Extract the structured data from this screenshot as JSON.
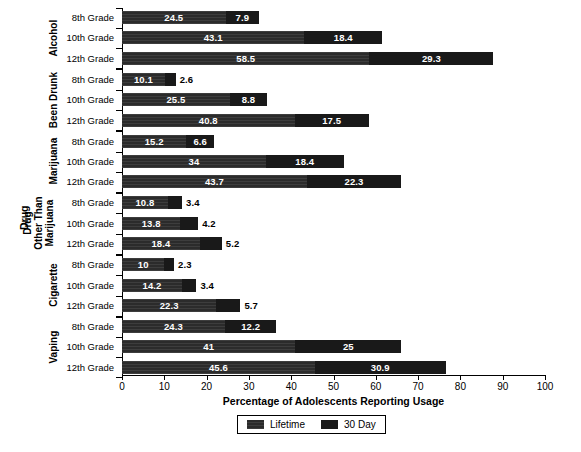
{
  "chart_data": {
    "type": "bar",
    "orientation": "horizontal",
    "stacked": true,
    "title": "",
    "xlabel": "Percentage of Adolescents Reporting Usage",
    "ylabel": "Drug",
    "xlim": [
      0,
      100
    ],
    "xticks": [
      "0",
      "10",
      "20",
      "30",
      "40",
      "50",
      "60",
      "70",
      "80",
      "90",
      "100"
    ],
    "grid": false,
    "legend_position": "bottom-center",
    "legend": [
      "Lifetime",
      "30 Day"
    ],
    "categories": [
      "8th Grade",
      "10th Grade",
      "12th Grade",
      "8th Grade",
      "10th Grade",
      "12th Grade",
      "8th Grade",
      "10th Grade",
      "12th Grade",
      "8th Grade",
      "10th Grade",
      "12th Grade",
      "8th Grade",
      "10th Grade",
      "12th Grade",
      "8th Grade",
      "10th Grade",
      "12th Grade"
    ],
    "groups": [
      {
        "label": "Alcohol",
        "rows": [
          {
            "grade": "8th Grade",
            "lifetime": 24.5,
            "day30": 7.9
          },
          {
            "grade": "10th Grade",
            "lifetime": 43.1,
            "day30": 18.4
          },
          {
            "grade": "12th Grade",
            "lifetime": 58.5,
            "day30": 29.3
          }
        ]
      },
      {
        "label": "Been Drunk",
        "rows": [
          {
            "grade": "8th Grade",
            "lifetime": 10.1,
            "day30": 2.6
          },
          {
            "grade": "10th Grade",
            "lifetime": 25.5,
            "day30": 8.8
          },
          {
            "grade": "12th Grade",
            "lifetime": 40.8,
            "day30": 17.5
          }
        ]
      },
      {
        "label": "Marijuana",
        "rows": [
          {
            "grade": "8th Grade",
            "lifetime": 15.2,
            "day30": 6.6
          },
          {
            "grade": "10th Grade",
            "lifetime": 34,
            "day30": 18.4
          },
          {
            "grade": "12th Grade",
            "lifetime": 43.7,
            "day30": 22.3
          }
        ]
      },
      {
        "label": "Drug Other Than Marijuana",
        "rows": [
          {
            "grade": "8th Grade",
            "lifetime": 10.8,
            "day30": 3.4
          },
          {
            "grade": "10th Grade",
            "lifetime": 13.8,
            "day30": 4.2
          },
          {
            "grade": "12th Grade",
            "lifetime": 18.4,
            "day30": 5.2
          }
        ]
      },
      {
        "label": "Cigarette",
        "rows": [
          {
            "grade": "8th Grade",
            "lifetime": 10,
            "day30": 2.3
          },
          {
            "grade": "10th Grade",
            "lifetime": 14.2,
            "day30": 3.4
          },
          {
            "grade": "12th Grade",
            "lifetime": 22.3,
            "day30": 5.7
          }
        ]
      },
      {
        "label": "Vaping",
        "rows": [
          {
            "grade": "8th Grade",
            "lifetime": 24.3,
            "day30": 12.2
          },
          {
            "grade": "10th Grade",
            "lifetime": 41,
            "day30": 25
          },
          {
            "grade": "12th Grade",
            "lifetime": 45.6,
            "day30": 30.9
          }
        ]
      }
    ],
    "series": [
      {
        "name": "Lifetime",
        "values": [
          24.5,
          43.1,
          58.5,
          10.1,
          25.5,
          40.8,
          15.2,
          34,
          43.7,
          10.8,
          13.8,
          18.4,
          10,
          14.2,
          22.3,
          24.3,
          41,
          45.6
        ]
      },
      {
        "name": "30 Day",
        "values": [
          7.9,
          18.4,
          29.3,
          2.6,
          8.8,
          17.5,
          6.6,
          18.4,
          22.3,
          3.4,
          4.2,
          5.2,
          2.3,
          3.4,
          5.7,
          12.2,
          25,
          30.9
        ]
      }
    ],
    "colors": {
      "lifetime": "#2b2b2b",
      "day30": "#191919",
      "axis": "#000000",
      "background": "#ffffff"
    }
  }
}
